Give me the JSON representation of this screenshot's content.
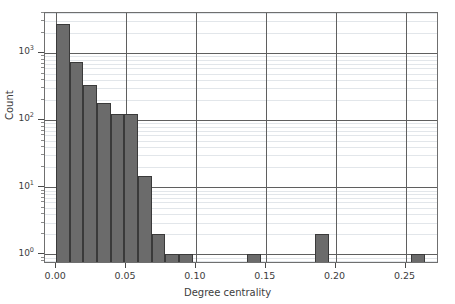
{
  "chart_data": {
    "type": "bar",
    "title": "",
    "xlabel": "Degree centrality",
    "ylabel": "Count",
    "yscale": "log",
    "xlim": [
      -0.008,
      0.274
    ],
    "ylim": [
      0.72,
      4000
    ],
    "grid": true,
    "legend": null,
    "bin_width": 0.00977,
    "x_ticks": [
      0.0,
      0.05,
      0.1,
      0.15,
      0.2,
      0.25
    ],
    "x_tick_labels": [
      "0.00",
      "0.05",
      "0.10",
      "0.15",
      "0.20",
      "0.25"
    ],
    "y_ticks": [
      1,
      10,
      100,
      1000
    ],
    "y_tick_labels": [
      "10⁰",
      "10¹",
      "10²",
      "10³"
    ],
    "bars": [
      {
        "x_left": 0.0,
        "x_right": 0.0098,
        "value": 2700
      },
      {
        "x_left": 0.0098,
        "x_right": 0.0195,
        "value": 750
      },
      {
        "x_left": 0.0195,
        "x_right": 0.0293,
        "value": 340
      },
      {
        "x_left": 0.0293,
        "x_right": 0.0391,
        "value": 185
      },
      {
        "x_left": 0.0391,
        "x_right": 0.0488,
        "value": 125
      },
      {
        "x_left": 0.0488,
        "x_right": 0.0586,
        "value": 125
      },
      {
        "x_left": 0.0586,
        "x_right": 0.0684,
        "value": 15
      },
      {
        "x_left": 0.0684,
        "x_right": 0.0781,
        "value": 2
      },
      {
        "x_left": 0.0781,
        "x_right": 0.0879,
        "value": 1
      },
      {
        "x_left": 0.0879,
        "x_right": 0.0977,
        "value": 1
      },
      {
        "x_left": 0.1367,
        "x_right": 0.1465,
        "value": 1
      },
      {
        "x_left": 0.1855,
        "x_right": 0.1953,
        "value": 2
      },
      {
        "x_left": 0.2539,
        "x_right": 0.2637,
        "value": 1
      }
    ],
    "colors": {
      "bar_fill": "#6b6b6b",
      "bar_edge": "#3a3a3a",
      "grid_major": "#5f5f5f",
      "grid_minor": "#e2e6ea",
      "axis": "#6f6f6f",
      "text": "#3d3d3d",
      "background": "#ffffff"
    }
  }
}
